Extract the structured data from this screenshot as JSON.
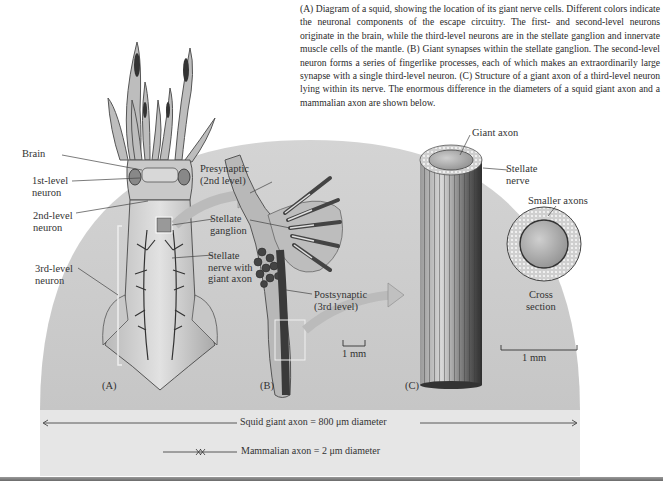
{
  "caption": "(A) Diagram of a squid, showing the location of its giant nerve cells. Different colors indicate the neuronal components of the escape circuitry. The first- and second-level neurons originate in the brain, while the third-level neurons are in the stellate ganglion and innervate muscle cells of the mantle. (B) Giant synapses within the stellate ganglion. The second-level neuron forms a series of fingerlike processes, each of which makes an extraordinarily large synapse with a single third-level neuron. (C) Structure of a giant axon of a third-level neuron lying within its nerve. The enormous difference in the diameters of a squid giant axon and a mammalian axon are shown below.",
  "panel_a": {
    "label": "(A)",
    "labels": {
      "brain": "Brain",
      "first_level_1": "1st-level",
      "first_level_2": "neuron",
      "second_level_1": "2nd-level",
      "second_level_2": "neuron",
      "third_level_1": "3rd-level",
      "third_level_2": "neuron",
      "stellate_ganglion_1": "Stellate",
      "stellate_ganglion_2": "ganglion",
      "stellate_nerve_1": "Stellate",
      "stellate_nerve_2": "nerve with",
      "stellate_nerve_3": "giant axon"
    }
  },
  "panel_b": {
    "label": "(B)",
    "labels": {
      "presynaptic_1": "Presynaptic",
      "presynaptic_2": "(2nd level)",
      "postsynaptic_1": "Postsynaptic",
      "postsynaptic_2": "(3rd level)"
    },
    "scale": "1 mm"
  },
  "panel_c": {
    "label": "(C)",
    "labels": {
      "giant_axon": "Giant axon",
      "stellate_nerve_1": "Stellate",
      "stellate_nerve_2": "nerve",
      "smaller_axons": "Smaller  axons",
      "cross_section_1": "Cross",
      "cross_section_2": "section"
    },
    "scale": "1 mm"
  },
  "comparison": {
    "squid": "Squid giant axon = 800 μm diameter",
    "mammal": "Mammalian axon = 2 μm diameter"
  },
  "colors": {
    "background": "#ffffff",
    "arc_gray": "#cfcfcf",
    "band_gray": "#e6e6e6",
    "text": "#2a2a2a"
  }
}
